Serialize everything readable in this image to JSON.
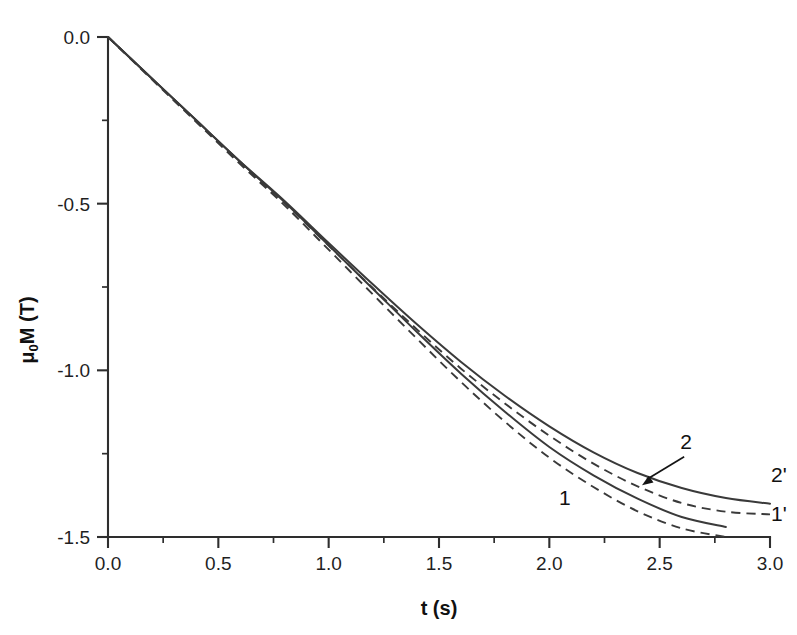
{
  "chart_data": {
    "type": "line",
    "title": "",
    "xlabel": "t (s)",
    "ylabel": "μ₀M (T)",
    "ylabel_parts": {
      "mu": "μ",
      "sub": "0",
      "rest": "M (T)"
    },
    "xlim": [
      0.0,
      3.0
    ],
    "ylim": [
      -1.5,
      0.0
    ],
    "grid": false,
    "legend_position": "inline-curve-labels",
    "xticks": [
      "0.0",
      "0.5",
      "1.0",
      "1.5",
      "2.0",
      "2.5",
      "3.0"
    ],
    "xtick_values": [
      0.0,
      0.5,
      1.0,
      1.5,
      2.0,
      2.5,
      3.0
    ],
    "xminor_step": 0.25,
    "yticks": [
      "0.0",
      "-0.5",
      "-1.0",
      "-1.5"
    ],
    "ytick_values": [
      0.0,
      -0.5,
      -1.0,
      -1.5
    ],
    "yminor_step": 0.25,
    "series": [
      {
        "name": "1",
        "label": "1",
        "style": "solid",
        "x": [
          0.0,
          0.2,
          0.4,
          0.6,
          0.8,
          1.0,
          1.2,
          1.4,
          1.6,
          1.8,
          2.0,
          2.2,
          2.4,
          2.6,
          2.8
        ],
        "values": [
          0.0,
          -0.125,
          -0.25,
          -0.375,
          -0.495,
          -0.625,
          -0.755,
          -0.885,
          -1.01,
          -1.125,
          -1.23,
          -1.315,
          -1.385,
          -1.44,
          -1.47
        ]
      },
      {
        "name": "1'",
        "label": "1'",
        "style": "dashed",
        "x": [
          0.0,
          0.2,
          0.4,
          0.6,
          0.8,
          1.0,
          1.2,
          1.4,
          1.6,
          1.8,
          2.0,
          2.2,
          2.4,
          2.6,
          2.8
        ],
        "values": [
          0.0,
          -0.128,
          -0.255,
          -0.382,
          -0.505,
          -0.638,
          -0.772,
          -0.905,
          -1.035,
          -1.155,
          -1.262,
          -1.35,
          -1.423,
          -1.474,
          -1.5
        ]
      },
      {
        "name": "2",
        "label": "2",
        "style": "solid",
        "x": [
          0.0,
          0.2,
          0.4,
          0.6,
          0.8,
          1.0,
          1.2,
          1.4,
          1.6,
          1.8,
          2.0,
          2.2,
          2.4,
          2.6,
          2.8,
          3.0
        ],
        "values": [
          0.0,
          -0.125,
          -0.25,
          -0.374,
          -0.492,
          -0.618,
          -0.742,
          -0.862,
          -0.975,
          -1.077,
          -1.168,
          -1.246,
          -1.308,
          -1.353,
          -1.383,
          -1.4
        ]
      },
      {
        "name": "2'",
        "label": "2'",
        "style": "dashed",
        "x": [
          0.0,
          0.2,
          0.4,
          0.6,
          0.8,
          1.0,
          1.2,
          1.4,
          1.6,
          1.8,
          2.0,
          2.2,
          2.4,
          2.6,
          2.8,
          3.0
        ],
        "values": [
          0.0,
          -0.126,
          -0.252,
          -0.378,
          -0.498,
          -0.626,
          -0.753,
          -0.877,
          -0.995,
          -1.1,
          -1.196,
          -1.28,
          -1.348,
          -1.398,
          -1.424,
          -1.432
        ]
      }
    ],
    "annotations": [
      {
        "text": "1",
        "x": 2.07,
        "y": -1.405,
        "kind": "curve-label"
      },
      {
        "text": "2",
        "x": 2.62,
        "y": -1.235,
        "kind": "curve-label-with-arrow",
        "arrow_to_x": 2.42,
        "arrow_to_y": -1.345
      },
      {
        "text": "2'",
        "x": 3.04,
        "y": -1.335,
        "kind": "curve-label"
      },
      {
        "text": "1'",
        "x": 3.04,
        "y": -1.452,
        "kind": "curve-label"
      }
    ],
    "colors": {
      "line": "#3a3a3a",
      "axis": "#2e2e2e",
      "text": "#111111",
      "background": "#ffffff"
    }
  }
}
